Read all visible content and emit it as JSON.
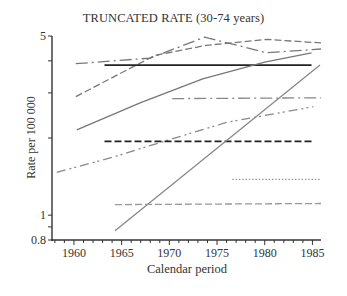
{
  "chart_data": {
    "type": "line",
    "title": "TRUNCATED RATE (30-74 years)",
    "xlabel": "Calendar period",
    "ylabel": "Rate per 100 000",
    "yscale": "log",
    "ylim": [
      0.8,
      5
    ],
    "xlim": [
      1957.7,
      1985.9
    ],
    "x_ticks": [
      1960,
      1965,
      1970,
      1975,
      1980,
      1985
    ],
    "y_tick_labels": [
      "0.8",
      "1",
      "5"
    ],
    "y_ticks": [
      0.8,
      0.9,
      1,
      2,
      3,
      4,
      5
    ],
    "grid": false,
    "legend": null,
    "series": [
      {
        "name": "series-1 (long dash-dot, gray)",
        "style": "dashdot",
        "color": "#777777",
        "x": [
          1960.2,
          1968,
          1973.7,
          1980.2,
          1985.9
        ],
        "y": [
          3.9,
          4.1,
          4.95,
          4.3,
          4.45
        ]
      },
      {
        "name": "series-2 (dashed, gray)",
        "style": "dashed",
        "color": "#777777",
        "x": [
          1960.2,
          1968.5,
          1973.9,
          1980.2,
          1985.9
        ],
        "y": [
          2.9,
          4.2,
          4.6,
          4.85,
          4.7
        ]
      },
      {
        "name": "series-3 (solid, black)",
        "style": "solid",
        "color": "#222222",
        "x": [
          1963.2,
          1984.9
        ],
        "y": [
          3.85,
          3.85
        ]
      },
      {
        "name": "series-4 (solid, gray)",
        "style": "solid",
        "color": "#777777",
        "x": [
          1960.3,
          1967,
          1973.5,
          1980,
          1984.9
        ],
        "y": [
          2.15,
          2.75,
          3.4,
          3.95,
          4.3
        ]
      },
      {
        "name": "series-5 (dash-dot, gray)",
        "style": "dashdot",
        "color": "#888888",
        "x": [
          1970.3,
          1985.9
        ],
        "y": [
          2.85,
          2.87
        ]
      },
      {
        "name": "series-6 (dash-dot-dot, gray)",
        "style": "dashdotdot",
        "color": "#888888",
        "x": [
          1958.2,
          1964,
          1970,
          1976,
          1985.1
        ],
        "y": [
          1.47,
          1.68,
          1.97,
          2.3,
          2.65
        ]
      },
      {
        "name": "series-7 (dashed, black)",
        "style": "dashed",
        "color": "#222222",
        "x": [
          1963.2,
          1984.9
        ],
        "y": [
          1.94,
          1.94
        ]
      },
      {
        "name": "series-8 (solid thin, gray)",
        "style": "solid",
        "color": "#888888",
        "x": [
          1964.3,
          1985.8
        ],
        "y": [
          0.87,
          3.85
        ]
      },
      {
        "name": "series-9 (dotted, gray)",
        "style": "dotted",
        "color": "#999999",
        "x": [
          1976.6,
          1985.9
        ],
        "y": [
          1.38,
          1.38
        ]
      },
      {
        "name": "series-10 (dashed, light gray)",
        "style": "dashed",
        "color": "#999999",
        "x": [
          1964.3,
          1985.9
        ],
        "y": [
          1.1,
          1.11
        ]
      }
    ]
  },
  "labels": {
    "title": "TRUNCATED RATE (30-74 years)",
    "xlabel": "Calendar period",
    "ylabel": "Rate per 100 000"
  }
}
